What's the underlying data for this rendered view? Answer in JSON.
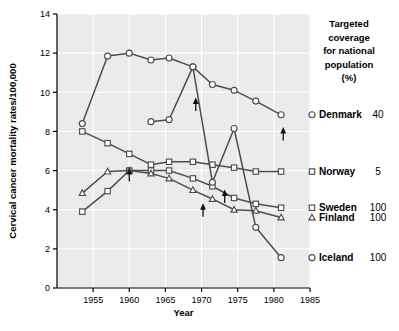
{
  "chart_data": {
    "type": "line",
    "title": "",
    "xlabel": "Year",
    "ylabel": "Cervical cancer mortality rates/100,000",
    "xlim": [
      1950,
      1985
    ],
    "ylim": [
      0,
      14
    ],
    "xticks": [
      1955,
      1960,
      1965,
      1970,
      1975,
      1980,
      1985
    ],
    "yticks": [
      0,
      2,
      4,
      6,
      8,
      10,
      12,
      14
    ],
    "grid": true,
    "legend_position": "right",
    "legend_header": [
      "Targeted",
      "coverage",
      "for national",
      "population",
      "(%)"
    ],
    "series": [
      {
        "name": "Denmark",
        "coverage": "40",
        "marker": "circle",
        "x": [
          1953.5,
          1957,
          1960,
          1963,
          1965.5,
          1968.8,
          1971.5,
          1974.5,
          1977.5,
          1981
        ],
        "y": [
          8.4,
          11.85,
          12.0,
          11.65,
          11.75,
          11.3,
          10.4,
          10.1,
          9.55,
          8.85
        ]
      },
      {
        "name": "Norway",
        "coverage": "5",
        "marker": "square",
        "x": [
          1953.5,
          1957,
          1960,
          1963,
          1965.5,
          1968.8,
          1971.5,
          1974.5,
          1977.5,
          1981
        ],
        "y": [
          8.0,
          7.4,
          6.85,
          6.3,
          6.45,
          6.45,
          6.3,
          6.15,
          5.95,
          5.95
        ]
      },
      {
        "name": "Sweden",
        "coverage": "100",
        "marker": "square",
        "x": [
          1953.5,
          1957,
          1960,
          1963,
          1965.5,
          1968.8,
          1971.5,
          1974.5,
          1977.5,
          1981
        ],
        "y": [
          3.9,
          4.95,
          6.0,
          6.0,
          6.0,
          5.6,
          5.2,
          4.6,
          4.3,
          4.1
        ]
      },
      {
        "name": "Finland",
        "coverage": "100",
        "marker": "triangle",
        "x": [
          1953.5,
          1957,
          1960,
          1963,
          1965.5,
          1968.8,
          1971.5,
          1974.5,
          1977.5,
          1981
        ],
        "y": [
          4.85,
          5.95,
          6.0,
          5.85,
          5.6,
          5.0,
          4.55,
          4.0,
          3.95,
          3.6
        ]
      },
      {
        "name": "Iceland",
        "coverage": "100",
        "marker": "circle",
        "x": [
          1963,
          1965.5,
          1968.8,
          1971.5,
          1974.5,
          1977.5,
          1981
        ],
        "y": [
          8.5,
          8.6,
          11.3,
          5.4,
          8.15,
          3.1,
          1.55
        ]
      }
    ],
    "annotations": [
      {
        "type": "arrow-up",
        "x": 1960,
        "y": 6.0,
        "note": "Norway screening start"
      },
      {
        "type": "arrow-up",
        "x": 1969.2,
        "y": 9.6,
        "note": "Iceland screening start"
      },
      {
        "type": "arrow-up",
        "x": 1970.2,
        "y": 4.2,
        "note": "Finland screening start"
      },
      {
        "type": "arrow-up",
        "x": 1973.2,
        "y": 4.9,
        "note": "Sweden screening start"
      },
      {
        "type": "arrow-up",
        "x": 1981.3,
        "y": 8.1,
        "note": "Denmark screening start"
      }
    ]
  },
  "legend": {
    "header_lines": [
      "Targeted",
      "coverage",
      "for national",
      "population",
      "(%)"
    ],
    "rows": [
      {
        "label": "Denmark",
        "value": "40"
      },
      {
        "label": "Norway",
        "value": "5"
      },
      {
        "label": "Sweden",
        "value": "100"
      },
      {
        "label": "Finland",
        "value": "100"
      },
      {
        "label": "Iceland",
        "value": "100"
      }
    ]
  },
  "style": {
    "plot_background": "#ebebeb",
    "grid_color": "#ffffff",
    "line_color": "#4d4d4d",
    "marker_face": "#ffffff",
    "axis_color": "#000000"
  }
}
